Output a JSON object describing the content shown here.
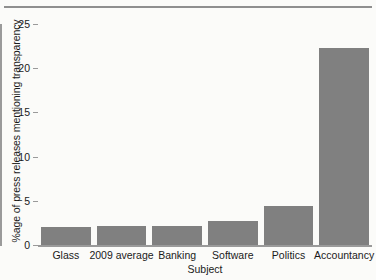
{
  "chart_data": {
    "type": "bar",
    "title": "",
    "xlabel": "Subject",
    "ylabel": "%age of press releases mentioning transparency",
    "categories": [
      "Glass",
      "2009 average",
      "Banking",
      "Software",
      "Politics",
      "Accountancy"
    ],
    "values": [
      2.0,
      2.2,
      2.2,
      2.7,
      4.4,
      22.3
    ],
    "ylim": [
      0,
      25
    ],
    "yticks": [
      0,
      5,
      10,
      15,
      20,
      25
    ],
    "ytick_labels": [
      "0",
      "5",
      "10",
      "15",
      "20",
      "25"
    ],
    "grid": false,
    "legend": null,
    "bar_color": "#808080",
    "axis_color": "#9a9a9a",
    "background_color": "#fbfbf9"
  },
  "figure": {
    "top_rule": ""
  }
}
